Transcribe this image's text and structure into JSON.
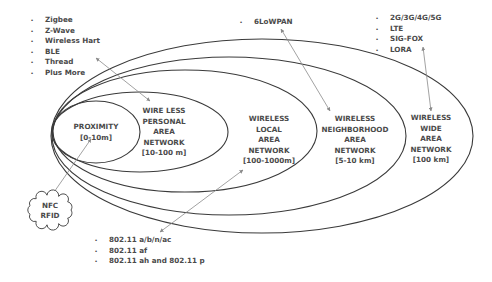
{
  "colors": {
    "background": "#ffffff",
    "ellipse_stroke": "#3a3a3a",
    "arrow_stroke": "#8a8a8a",
    "text": "#4a4a4a"
  },
  "networks": [
    {
      "id": "proximity",
      "lines": [
        "PROXIMITY",
        "[0-10m]"
      ],
      "range": "[0-10m]",
      "ellipse": {
        "cx": 96,
        "cy": 132,
        "rx": 44,
        "ry": 31
      },
      "label_pos": {
        "x": 96,
        "y": 129
      }
    },
    {
      "id": "wpan",
      "lines": [
        "WIRE LESS",
        "PERSONAL",
        "AREA",
        "NETWORK",
        "[10-100 m]"
      ],
      "range": "[10-100 m]",
      "ellipse": {
        "cx": 140,
        "cy": 132,
        "rx": 88,
        "ry": 40
      },
      "label_pos": {
        "x": 164,
        "y": 113
      }
    },
    {
      "id": "wlan",
      "lines": [
        "WIRELESS",
        "LOCAL",
        "AREA",
        "NETWORK",
        "[100-1000m]"
      ],
      "range": "[100-1000m]",
      "ellipse": {
        "cx": 185,
        "cy": 131,
        "rx": 132,
        "ry": 61
      },
      "label_pos": {
        "x": 269,
        "y": 121
      }
    },
    {
      "id": "wnan",
      "lines": [
        "WIRELESS",
        "NEIGHBORHOOD",
        "AREA",
        "NETWORK",
        "[5-10 km]"
      ],
      "range": "[5-10 km]",
      "ellipse": {
        "cx": 229,
        "cy": 136,
        "rx": 177,
        "ry": 79
      },
      "label_pos": {
        "x": 355,
        "y": 121
      }
    },
    {
      "id": "wwan",
      "lines": [
        "WIRELESS",
        "WIDE",
        "AREA",
        "NETWORK",
        "[100 km]"
      ],
      "range": "[100 km]",
      "ellipse": {
        "cx": 262,
        "cy": 136,
        "rx": 211,
        "ry": 97
      },
      "label_pos": {
        "x": 431,
        "y": 120
      }
    }
  ],
  "technology_lists": [
    {
      "id": "wpan-technologies",
      "bullets": true,
      "items": [
        "Zigbee",
        "Z-Wave",
        "Wireless Hart",
        "BLE",
        "Thread",
        "Plus More"
      ],
      "pos": {
        "x": 45,
        "y": 22
      },
      "line_height": 10.5
    },
    {
      "id": "wnan-technologies",
      "bullets": true,
      "items": [
        "6LoWPAN"
      ],
      "pos": {
        "x": 254,
        "y": 24
      },
      "line_height": 10.5
    },
    {
      "id": "wwan-technologies",
      "bullets": true,
      "items": [
        "2G/3G/4G/5G",
        "LTE",
        "SIG-FOX",
        "LORA"
      ],
      "pos": {
        "x": 390,
        "y": 20
      },
      "line_height": 10.5
    },
    {
      "id": "wlan-technologies",
      "bullets": true,
      "items": [
        "802.11 a/b/n/ac",
        "802.11 af",
        "802.11 ah and 802.11 p"
      ],
      "pos": {
        "x": 109,
        "y": 242
      },
      "line_height": 10.5
    }
  ],
  "cloud": {
    "lines": [
      "NFC",
      "RFID"
    ],
    "center": {
      "x": 50,
      "y": 210
    }
  },
  "arrows": [
    {
      "id": "arrow-wpan",
      "x1": 96,
      "y1": 58,
      "x2": 150,
      "y2": 101
    },
    {
      "id": "arrow-wnan",
      "x1": 281,
      "y1": 29,
      "x2": 330,
      "y2": 111
    },
    {
      "id": "arrow-wwan",
      "x1": 423,
      "y1": 47,
      "x2": 431,
      "y2": 111
    },
    {
      "id": "arrow-nfc",
      "x1": 52,
      "y1": 195,
      "x2": 91,
      "y2": 139
    },
    {
      "id": "arrow-wlan",
      "x1": 160,
      "y1": 232,
      "x2": 243,
      "y2": 170
    }
  ]
}
